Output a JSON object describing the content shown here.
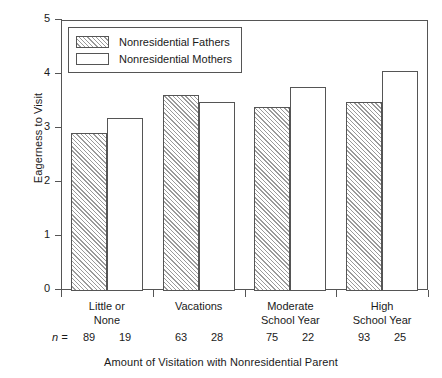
{
  "chart_data": {
    "type": "bar",
    "title": "",
    "xlabel": "Amount of Visitation with Nonresidential Parent",
    "ylabel": "Eagerness to Visit",
    "ylim": [
      0,
      5
    ],
    "yticks": [
      0,
      1,
      2,
      3,
      4,
      5
    ],
    "ytick_labels": [
      "0",
      "1",
      "2",
      "3",
      "4",
      "5"
    ],
    "grid": false,
    "legend_position": "upper left",
    "categories": [
      "Little or None",
      "Vacations",
      "Moderate School Year",
      "High School Year"
    ],
    "category_lines": [
      [
        "Little or",
        "None"
      ],
      [
        "Vacations",
        ""
      ],
      [
        "Moderate",
        "School Year"
      ],
      [
        "High",
        "School Year"
      ]
    ],
    "series": [
      {
        "name": "Nonresidential Fathers",
        "fill": "hatched",
        "values": [
          2.91,
          3.61,
          3.38,
          3.48
        ],
        "n": [
          89,
          63,
          75,
          93
        ]
      },
      {
        "name": "Nonresidential Mothers",
        "fill": "white",
        "values": [
          3.19,
          3.49,
          3.76,
          4.05
        ],
        "n": [
          19,
          28,
          22,
          25
        ]
      }
    ],
    "annotations": {
      "n_label": "n ="
    },
    "colors": {
      "axis": "#555555",
      "bar_edge": "#555555",
      "hatch": "#9a9a9a",
      "background": "#ffffff",
      "text": "#1a1a1a"
    }
  }
}
